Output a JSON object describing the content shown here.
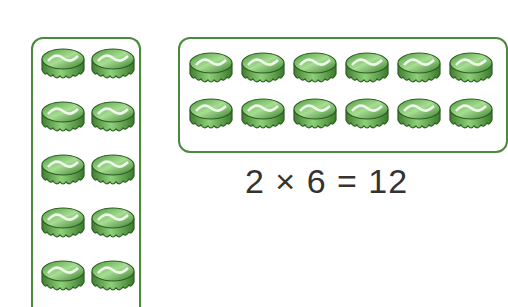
{
  "left_array": {
    "rows_visible": 5,
    "cols": 2
  },
  "right_array": {
    "rows": 2,
    "cols": 6
  },
  "equation": "2 × 6 = 12",
  "colors": {
    "box_border": "#4a8a3a",
    "cap_light": "#8fd07a",
    "cap_mid": "#4f9c3e",
    "cap_dark": "#2d5e22",
    "text": "#333333"
  },
  "icon": "bottle-cap-icon"
}
